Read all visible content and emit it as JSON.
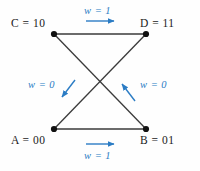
{
  "diagram": {
    "title_text": "",
    "background_color": "#fefefe",
    "edge_color": "#3a3a3a",
    "node_color": "#111111",
    "annotation_color": "#2b7cc4",
    "nodes": [
      {
        "id": "C",
        "label": "C  =  10",
        "state": "10",
        "x": 54,
        "y": 34,
        "label_x": 11,
        "label_y": 17
      },
      {
        "id": "D",
        "label": "D  =  11",
        "state": "11",
        "x": 146,
        "y": 34,
        "label_x": 140,
        "label_y": 17
      },
      {
        "id": "A",
        "label": "A  =  00",
        "state": "00",
        "x": 54,
        "y": 129,
        "label_x": 11,
        "label_y": 134
      },
      {
        "id": "B",
        "label": "B  =  01",
        "state": "01",
        "x": 146,
        "y": 129,
        "label_x": 140,
        "label_y": 134
      }
    ],
    "edges": [
      {
        "from": "C",
        "to": "D",
        "weight_label": "w  =  1",
        "weight": "1",
        "arrow_direction": "right"
      },
      {
        "from": "A",
        "to": "B",
        "weight_label": "w  =  1",
        "weight": "1",
        "arrow_direction": "right"
      },
      {
        "from": "C",
        "to": "B",
        "weight_label": "w  =  0",
        "weight": "0",
        "arrow_direction": "down-left"
      },
      {
        "from": "D",
        "to": "A",
        "weight_label": "w  =  0",
        "weight": "0",
        "arrow_direction": "up-left"
      }
    ],
    "weights": {
      "top": "w  =  1",
      "bottom": "w  =  1",
      "left": "w  =  0",
      "right": "w  =  0"
    }
  }
}
